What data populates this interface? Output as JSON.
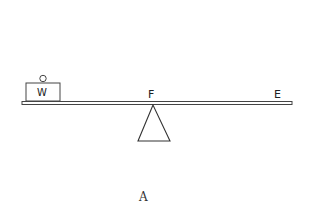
{
  "diagram": {
    "type": "lever",
    "caption": "A",
    "labels": {
      "weight": "W",
      "fulcrum": "F",
      "effort": "E"
    },
    "colors": {
      "stroke": "#333333",
      "background": "#ffffff"
    }
  }
}
